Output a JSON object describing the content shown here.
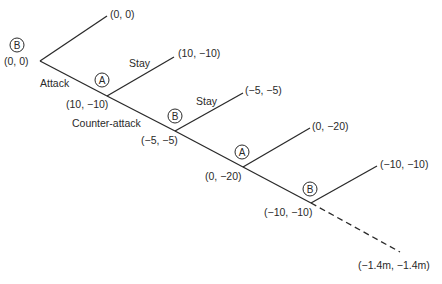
{
  "diagram": {
    "type": "game-tree",
    "players": [
      "A",
      "B"
    ],
    "decision_nodes": [
      {
        "player": "B",
        "payoff": "(0, 0)"
      },
      {
        "player": "A",
        "payoff": "(10, −10)"
      },
      {
        "player": "B",
        "payoff": "(−5, −5)"
      },
      {
        "player": "A",
        "payoff": "(0, −20)"
      },
      {
        "player": "B",
        "payoff": "(−10, −10)"
      }
    ],
    "terminal_payoffs": [
      "(0, 0)",
      "(10, −10)",
      "(−5, −5)",
      "(0, −20)",
      "(−10, −10)",
      "(−1.4m, −1.4m)"
    ],
    "edge_labels": {
      "attack": "Attack",
      "stay_1": "Stay",
      "counter_attack": "Counter-attack",
      "stay_2": "Stay"
    }
  }
}
